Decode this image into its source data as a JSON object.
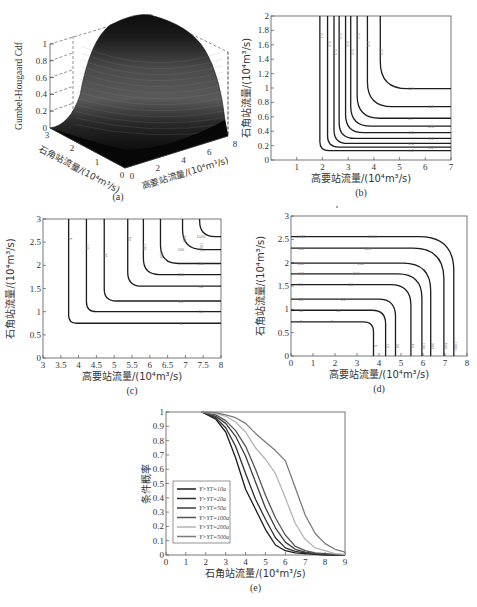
{
  "figure": {
    "panels": [
      "(a)",
      "(b)",
      "(c)",
      "(d)",
      "(e)"
    ]
  },
  "chart_data": [
    {
      "id": "a",
      "type": "surface3d",
      "caption": "(a)",
      "zlabel": "Gumbel-Hougaard Cdf",
      "xlabel": "高要站流量/(10⁴m³/s)",
      "ylabel": "石角站流量/(10⁴m³/s)",
      "xticks": [
        "0",
        "2",
        "4",
        "6",
        "8"
      ],
      "yticks": [
        "0",
        "1",
        "2",
        "3"
      ],
      "zticks": [
        "0",
        "0.2",
        "0.4",
        "0.6",
        "0.8",
        "1"
      ],
      "xlim": [
        0,
        8
      ],
      "ylim": [
        0,
        3
      ],
      "zlim": [
        0,
        1
      ]
    },
    {
      "id": "b",
      "type": "contour",
      "caption": "(b)",
      "xlabel": "高要站流量/(10⁴m³/s)",
      "ylabel": "石角站流量/(10⁴m³/s)",
      "xlim": [
        0,
        7
      ],
      "ylim": [
        0,
        2
      ],
      "xticks": [
        "1",
        "2",
        "3",
        "4",
        "5",
        "6",
        "7"
      ],
      "yticks": [
        "0",
        "0.2",
        "0.4",
        "0.6",
        "0.8",
        "1",
        "1.2",
        "1.4",
        "1.6",
        "1.8",
        "2"
      ],
      "levels": [
        {
          "label": "0.1",
          "xv": 1.9,
          "yh": 0.13
        },
        {
          "label": "0.2",
          "xv": 2.2,
          "yh": 0.18
        },
        {
          "label": "0.3",
          "xv": 2.45,
          "yh": 0.23
        },
        {
          "label": "0.4",
          "xv": 2.65,
          "yh": 0.3
        },
        {
          "label": "0.5",
          "xv": 2.9,
          "yh": 0.38
        },
        {
          "label": "0.6",
          "xv": 3.1,
          "yh": 0.47
        },
        {
          "label": "0.7",
          "xv": 3.35,
          "yh": 0.58
        },
        {
          "label": "0.8",
          "xv": 3.75,
          "yh": 0.74
        },
        {
          "label": "0.9",
          "xv": 4.25,
          "yh": 0.99
        }
      ]
    },
    {
      "id": "c",
      "type": "contour",
      "caption": "(c)",
      "xlabel": "高要站流量/(10⁴m³/s)",
      "ylabel": "石角站流量/(10⁴m³/s)",
      "xlim": [
        3,
        8
      ],
      "ylim": [
        0,
        3
      ],
      "xticks": [
        "3",
        "3.5",
        "4",
        "4.5",
        "5",
        "5.5",
        "6",
        "6.5",
        "7",
        "7.5",
        "8"
      ],
      "yticks": [
        "0",
        "0.5",
        "1",
        "1.5",
        "2",
        "2.5",
        "3"
      ],
      "levels": [
        {
          "label": "5",
          "xv": 3.72,
          "yh": 0.75
        },
        {
          "label": "10",
          "xv": 4.22,
          "yh": 1.0
        },
        {
          "label": "20",
          "xv": 4.72,
          "yh": 1.23
        },
        {
          "label": "50",
          "xv": 5.38,
          "yh": 1.55
        },
        {
          "label": "100",
          "xv": 5.82,
          "yh": 1.8
        },
        {
          "label": "200",
          "xv": 6.3,
          "yh": 2.04
        },
        {
          "label": "500",
          "xv": 6.92,
          "yh": 2.34
        },
        {
          "label": "1000",
          "xv": 7.4,
          "yh": 2.62
        }
      ]
    },
    {
      "id": "d",
      "type": "contour",
      "caption": "(d)",
      "xlabel": "高要站流量/(10⁴m³/s)",
      "ylabel": "石角站流量/(10⁴m³/s)",
      "xlim": [
        0,
        8
      ],
      "ylim": [
        0,
        3
      ],
      "xticks": [
        "0",
        "1",
        "2",
        "3",
        "4",
        "5",
        "6",
        "7",
        "8"
      ],
      "yticks": [
        "0",
        "0.5",
        "1",
        "1.5",
        "2",
        "2.5",
        "3"
      ],
      "levels": [
        {
          "label": "5",
          "xv": 3.75,
          "yh": 0.73
        },
        {
          "label": "10",
          "xv": 4.3,
          "yh": 0.98
        },
        {
          "label": "20",
          "xv": 4.75,
          "yh": 1.22
        },
        {
          "label": "50",
          "xv": 5.45,
          "yh": 1.53
        },
        {
          "label": "100",
          "xv": 5.95,
          "yh": 1.76
        },
        {
          "label": "200",
          "xv": 6.35,
          "yh": 1.99
        },
        {
          "label": "500",
          "xv": 6.95,
          "yh": 2.31
        },
        {
          "label": "1000",
          "xv": 7.4,
          "yh": 2.56
        }
      ]
    },
    {
      "id": "e",
      "type": "line",
      "caption": "(e)",
      "xlabel": "石角站流量/(10⁴m³/s)",
      "ylabel": "条件概率",
      "xlim": [
        0,
        9
      ],
      "ylim": [
        0,
        1
      ],
      "xticks": [
        "0",
        "1",
        "2",
        "3",
        "4",
        "5",
        "6",
        "7",
        "8",
        "9"
      ],
      "yticks": [
        "0",
        "0.1",
        "0.2",
        "0.3",
        "0.4",
        "0.5",
        "0.6",
        "0.7",
        "0.8",
        "0.9",
        "1"
      ],
      "legend_position": "lower-left",
      "x": [
        1.8,
        2.5,
        3.0,
        3.5,
        4.0,
        4.5,
        5.0,
        5.5,
        6.0,
        6.5,
        7.0,
        7.5,
        8.0,
        8.5,
        9.0
      ],
      "series": [
        {
          "name": "Y>Y_{T=10a}",
          "color": "#1a1a1a",
          "values": [
            1.0,
            0.95,
            0.86,
            0.68,
            0.46,
            0.32,
            0.18,
            0.07,
            0.03,
            0.015,
            0.01,
            0.005,
            0.0,
            0.0,
            0.0
          ]
        },
        {
          "name": "Y>Y_{T=20a}",
          "color": "#2e2e2e",
          "values": [
            1.0,
            0.96,
            0.89,
            0.76,
            0.57,
            0.39,
            0.25,
            0.12,
            0.05,
            0.025,
            0.015,
            0.01,
            0.005,
            0.0,
            0.0
          ]
        },
        {
          "name": "Y>Y_{T=50a}",
          "color": "#3d3d3d",
          "values": [
            1.0,
            0.97,
            0.92,
            0.83,
            0.69,
            0.51,
            0.33,
            0.19,
            0.09,
            0.04,
            0.02,
            0.01,
            0.005,
            0.0,
            0.0
          ]
        },
        {
          "name": "Y>Y_{T=100a}",
          "color": "#555555",
          "values": [
            1.0,
            0.98,
            0.94,
            0.87,
            0.76,
            0.6,
            0.42,
            0.26,
            0.14,
            0.06,
            0.03,
            0.015,
            0.01,
            0.005,
            0.0
          ]
        },
        {
          "name": "Y>Y_{T=200a}",
          "color": "#b5b5b5",
          "values": [
            1.0,
            0.99,
            0.97,
            0.93,
            0.86,
            0.75,
            0.67,
            0.57,
            0.4,
            0.22,
            0.11,
            0.05,
            0.03,
            0.01,
            0.005
          ]
        },
        {
          "name": "Y>Y_{T=500a}",
          "color": "#7a7a7a",
          "values": [
            1.0,
            0.995,
            0.98,
            0.96,
            0.92,
            0.85,
            0.79,
            0.73,
            0.66,
            0.47,
            0.28,
            0.15,
            0.08,
            0.04,
            0.02
          ]
        }
      ]
    }
  ]
}
